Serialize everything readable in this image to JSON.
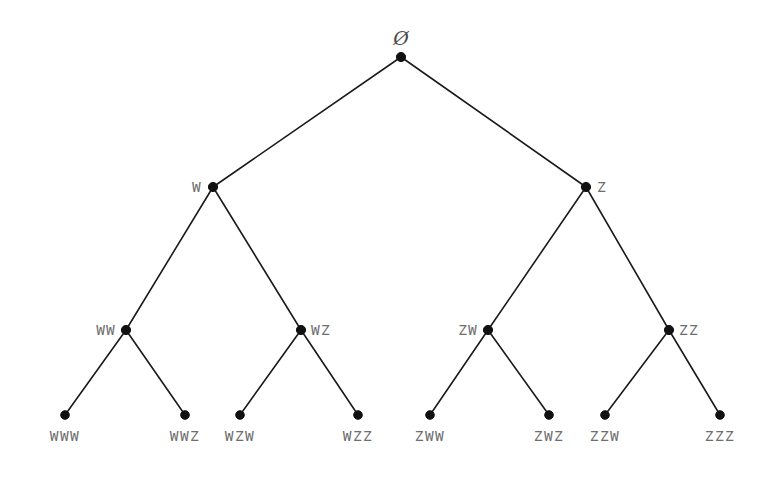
{
  "figure": {
    "type": "tree-diagram",
    "title": "",
    "background_color": "#ffffff",
    "edge_color": "#1a1a1a",
    "node_color": "#111111",
    "label_color": "#6e6e6e",
    "alphabet": [
      "W",
      "Z"
    ],
    "depth": 3
  },
  "nodes": [
    {
      "id": "root",
      "label": "Ø",
      "x": 401,
      "y": 57,
      "label_side": "above",
      "label_dx": 0,
      "label_dy": -9,
      "level": 0,
      "kind": "root"
    },
    {
      "id": "W",
      "label": "W",
      "x": 213,
      "y": 187,
      "label_side": "left",
      "label_dx": -11,
      "label_dy": 0,
      "level": 1,
      "kind": "internal"
    },
    {
      "id": "Z",
      "label": "Z",
      "x": 586,
      "y": 187,
      "label_side": "right",
      "label_dx": 11,
      "label_dy": 0,
      "level": 1,
      "kind": "internal"
    },
    {
      "id": "WW",
      "label": "WW",
      "x": 126,
      "y": 330,
      "label_side": "left",
      "label_dx": -10,
      "label_dy": 0,
      "level": 2,
      "kind": "internal"
    },
    {
      "id": "WZ",
      "label": "WZ",
      "x": 301,
      "y": 330,
      "label_side": "right",
      "label_dx": 10,
      "label_dy": 0,
      "level": 2,
      "kind": "internal"
    },
    {
      "id": "ZW",
      "label": "ZW",
      "x": 488,
      "y": 330,
      "label_side": "left",
      "label_dx": -10,
      "label_dy": 0,
      "level": 2,
      "kind": "internal"
    },
    {
      "id": "ZZ",
      "label": "ZZ",
      "x": 669,
      "y": 330,
      "label_side": "right",
      "label_dx": 10,
      "label_dy": 0,
      "level": 2,
      "kind": "internal"
    },
    {
      "id": "WWW",
      "label": "WWW",
      "x": 65,
      "y": 415,
      "label_side": "below",
      "label_dx": 0,
      "label_dy": 14,
      "level": 3,
      "kind": "leaf"
    },
    {
      "id": "WWZ",
      "label": "WWZ",
      "x": 185,
      "y": 415,
      "label_side": "below",
      "label_dx": 0,
      "label_dy": 14,
      "level": 3,
      "kind": "leaf"
    },
    {
      "id": "WZW",
      "label": "WZW",
      "x": 240,
      "y": 415,
      "label_side": "below",
      "label_dx": 0,
      "label_dy": 14,
      "level": 3,
      "kind": "leaf"
    },
    {
      "id": "WZZ",
      "label": "WZZ",
      "x": 358,
      "y": 415,
      "label_side": "below",
      "label_dx": 0,
      "label_dy": 14,
      "level": 3,
      "kind": "leaf"
    },
    {
      "id": "ZWW",
      "label": "ZWW",
      "x": 430,
      "y": 415,
      "label_side": "below",
      "label_dx": 0,
      "label_dy": 14,
      "level": 3,
      "kind": "leaf"
    },
    {
      "id": "ZWZ",
      "label": "ZWZ",
      "x": 549,
      "y": 415,
      "label_side": "below",
      "label_dx": 0,
      "label_dy": 14,
      "level": 3,
      "kind": "leaf"
    },
    {
      "id": "ZZW",
      "label": "ZZW",
      "x": 605,
      "y": 415,
      "label_side": "below",
      "label_dx": 0,
      "label_dy": 14,
      "level": 3,
      "kind": "leaf"
    },
    {
      "id": "ZZZ",
      "label": "ZZZ",
      "x": 720,
      "y": 415,
      "label_side": "below",
      "label_dx": 0,
      "label_dy": 14,
      "level": 3,
      "kind": "leaf"
    }
  ],
  "edges": [
    {
      "from": "root",
      "to": "W"
    },
    {
      "from": "root",
      "to": "Z"
    },
    {
      "from": "W",
      "to": "WW"
    },
    {
      "from": "W",
      "to": "WZ"
    },
    {
      "from": "Z",
      "to": "ZW"
    },
    {
      "from": "Z",
      "to": "ZZ"
    },
    {
      "from": "WW",
      "to": "WWW"
    },
    {
      "from": "WW",
      "to": "WWZ"
    },
    {
      "from": "WZ",
      "to": "WZW"
    },
    {
      "from": "WZ",
      "to": "WZZ"
    },
    {
      "from": "ZW",
      "to": "ZWW"
    },
    {
      "from": "ZW",
      "to": "ZWZ"
    },
    {
      "from": "ZZ",
      "to": "ZZW"
    },
    {
      "from": "ZZ",
      "to": "ZZZ"
    }
  ]
}
